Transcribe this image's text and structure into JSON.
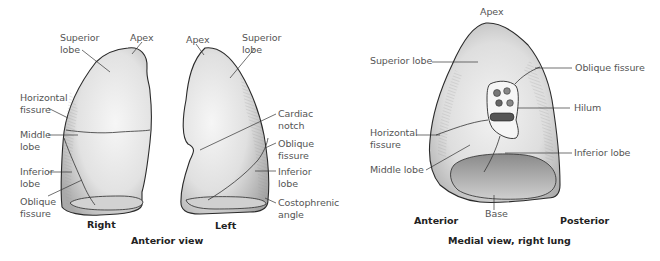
{
  "anterior_view": {
    "caption": "Anterior view",
    "right_lung": {
      "caption": "Right",
      "labels": {
        "superior_lobe": [
          "Superior",
          "lobe"
        ],
        "apex": "Apex",
        "horizontal_fissure": [
          "Horizontal",
          "fissure"
        ],
        "middle_lobe": [
          "Middle",
          "lobe"
        ],
        "inferior_lobe": [
          "Inferior",
          "lobe"
        ],
        "oblique_fissure": [
          "Oblique",
          "fissure"
        ]
      }
    },
    "left_lung": {
      "caption": "Left",
      "labels": {
        "apex": "Apex",
        "superior_lobe": [
          "Superior",
          "lobe"
        ],
        "cardiac_notch": [
          "Cardiac",
          "notch"
        ],
        "oblique_fissure": [
          "Oblique",
          "fissure"
        ],
        "inferior_lobe": [
          "Inferior",
          "lobe"
        ],
        "costophrenic_angle": [
          "Costophrenic",
          "angle"
        ]
      }
    }
  },
  "medial_view": {
    "caption": "Medial view, right lung",
    "orientation": {
      "anterior": "Anterior",
      "posterior": "Posterior"
    },
    "labels": {
      "apex": "Apex",
      "superior_lobe": "Superior lobe",
      "oblique_fissure": "Oblique fissure",
      "hilum": "Hilum",
      "horizontal_fissure": [
        "Horizontal",
        "fissure"
      ],
      "inferior_lobe": "Inferior lobe",
      "middle_lobe": "Middle lobe",
      "base": "Base"
    }
  },
  "colors": {
    "lung_fill": "#e4e4e4",
    "lung_highlight": "#f4f4f4",
    "shade": "#a8a8a8",
    "outline": "#2a2a2a",
    "leader": "#333333"
  }
}
